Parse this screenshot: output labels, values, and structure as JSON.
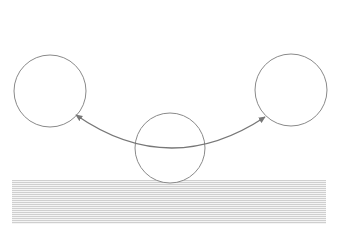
{
  "diagram": {
    "background": "#ffffff",
    "stroke_color": "#8a8a8a",
    "arrow_color": "#777777",
    "circles": [
      {
        "id": "left",
        "cx": 50,
        "cy": 91,
        "r": 36
      },
      {
        "id": "middle",
        "cx": 170,
        "cy": 148,
        "r": 35
      },
      {
        "id": "right",
        "cx": 291,
        "cy": 90,
        "r": 36
      }
    ],
    "arrow": {
      "type": "double-headed curved arc",
      "start": [
        76,
        115
      ],
      "control": [
        170,
        180
      ],
      "end": [
        265,
        117
      ]
    },
    "ground_band": {
      "x": 12,
      "y": 180,
      "width": 314,
      "height": 44,
      "pattern": "horizontal hatch lines"
    }
  }
}
